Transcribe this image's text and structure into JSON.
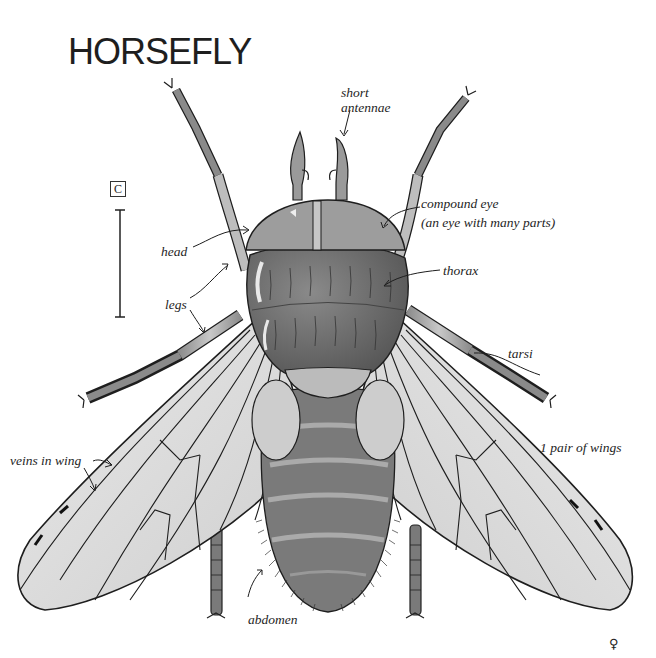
{
  "diagram": {
    "title": "HORSEFLY",
    "scale_marker": "C",
    "sex_symbol": "♀",
    "labels": {
      "short_antennae_1": "short",
      "short_antennae_2": "antennae",
      "compound_eye_1": "compound eye",
      "compound_eye_2": "(an eye with many parts)",
      "head": "head",
      "thorax": "thorax",
      "legs": "legs",
      "tarsi": "tarsi",
      "veins_in_wing": "veins in wing",
      "wings": "1 pair of wings",
      "abdomen": "abdomen"
    },
    "colors": {
      "ink": "#1e1e1e",
      "wing_fill": "#dcdcdc",
      "body_dark": "#6e6e6e",
      "body_mid": "#8c8c8c",
      "head_fill": "#9a9a9a",
      "background": "#ffffff"
    }
  }
}
